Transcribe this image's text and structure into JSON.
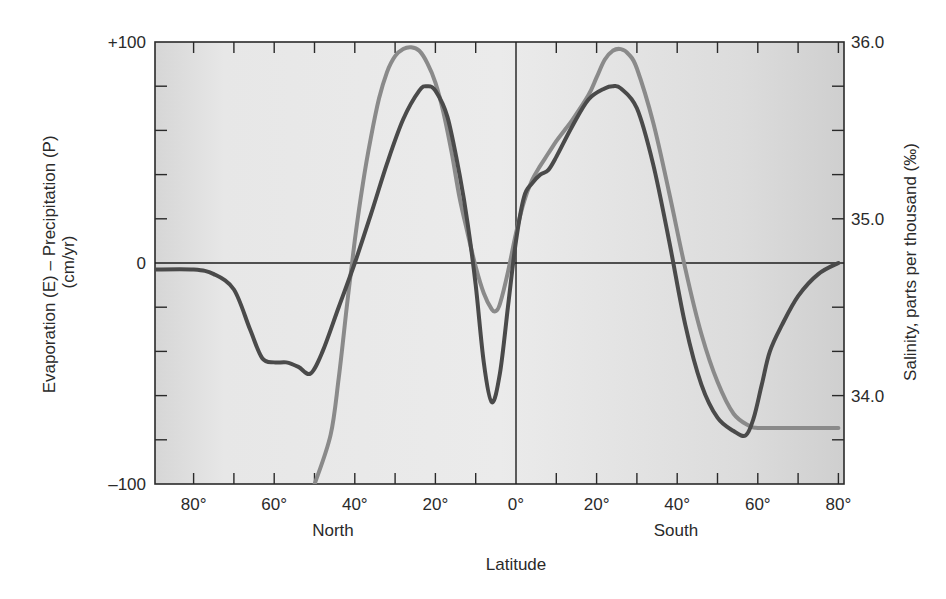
{
  "chart_data": {
    "type": "line",
    "title": "",
    "xlabel": "Latitude",
    "x_region_labels": [
      "North",
      "South"
    ],
    "ylabel_left": "Evaporation (E) – Precipitation (P) (cm/yr)",
    "ylabel_right": "Salinity, parts per thousand (‰)",
    "x_tick_labels": [
      "80°",
      "60°",
      "40°",
      "20°",
      "0°",
      "20°",
      "40°",
      "60°",
      "80°"
    ],
    "x_ticks_signed": [
      80,
      60,
      40,
      20,
      0,
      -20,
      -40,
      -60,
      -80
    ],
    "x_note": "positive = degrees North, negative = degrees South",
    "xlim": [
      90,
      -80
    ],
    "y_left_tick_labels": [
      "+100",
      "0",
      "–100"
    ],
    "y_left_ticks": [
      100,
      0,
      -100
    ],
    "ylim_left": [
      -100,
      100
    ],
    "y_right_tick_labels": [
      "36.0",
      "35.0",
      "34.0"
    ],
    "y_right_ticks": [
      36.0,
      35.0,
      34.0
    ],
    "ylim_right": [
      33.5,
      36.0
    ],
    "grid": false,
    "zero_line": true,
    "equator_line": true,
    "legend": null,
    "series": [
      {
        "name": "Evaporation – Precipitation (E – P)",
        "axis": "left",
        "color": "#4a4a4a",
        "x": [
          90,
          80,
          75,
          70,
          66,
          63,
          60,
          57,
          54,
          51,
          48,
          44,
          40,
          36,
          32,
          28,
          24,
          22,
          20,
          17,
          14,
          12,
          10,
          8,
          6,
          4,
          2,
          0,
          -2,
          -4,
          -6,
          -8,
          -10,
          -14,
          -18,
          -22,
          -24,
          -26,
          -30,
          -34,
          -38,
          -42,
          -46,
          -50,
          -54,
          -57,
          -59,
          -61,
          -63,
          -66,
          -70,
          -75,
          -80
        ],
        "values": [
          -3,
          -3,
          -5,
          -12,
          -30,
          -43,
          -45,
          -45,
          -47,
          -50,
          -40,
          -20,
          0,
          22,
          45,
          65,
          78,
          80,
          78,
          66,
          40,
          18,
          -10,
          -45,
          -63,
          -50,
          -20,
          10,
          30,
          36,
          40,
          42,
          48,
          62,
          74,
          79,
          80,
          79,
          70,
          45,
          10,
          -28,
          -55,
          -70,
          -76,
          -78,
          -70,
          -55,
          -40,
          -28,
          -15,
          -5,
          0
        ]
      },
      {
        "name": "Surface salinity",
        "axis": "right",
        "color": "#8a8a8a",
        "x": [
          50,
          46,
          44,
          42,
          40,
          38,
          36,
          34,
          32,
          30,
          28,
          26,
          24,
          22,
          20,
          18,
          16,
          14,
          12,
          10,
          8,
          6,
          5,
          4,
          2,
          0,
          -2,
          -4,
          -6,
          -8,
          -10,
          -12,
          -14,
          -18,
          -20,
          -22,
          -24,
          -26,
          -28,
          -30,
          -34,
          -38,
          -42,
          -46,
          -50,
          -54,
          -58,
          -60,
          -65,
          -70,
          -75,
          -80
        ],
        "values": [
          33.5,
          33.78,
          34.1,
          34.5,
          34.88,
          35.2,
          35.46,
          35.68,
          35.83,
          35.92,
          35.96,
          35.97,
          35.95,
          35.88,
          35.77,
          35.6,
          35.38,
          35.12,
          34.92,
          34.73,
          34.58,
          34.49,
          34.48,
          34.52,
          34.7,
          34.92,
          35.1,
          35.22,
          35.3,
          35.37,
          35.44,
          35.5,
          35.56,
          35.7,
          35.8,
          35.9,
          35.95,
          35.96,
          35.93,
          35.85,
          35.55,
          35.15,
          34.72,
          34.35,
          34.08,
          33.9,
          33.83,
          33.82,
          33.82,
          33.82,
          33.82,
          33.82
        ]
      }
    ]
  }
}
